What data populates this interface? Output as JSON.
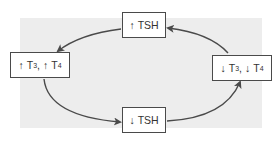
{
  "diagram": {
    "type": "feedback-cycle",
    "nodes": {
      "top": {
        "arrow": "↑",
        "label": "TSH"
      },
      "left": {
        "arrow1": "↑",
        "t1": "T",
        "sub1": "3",
        "sep": ",",
        "arrow2": "↑",
        "t2": "T",
        "sub2": "4"
      },
      "bottom": {
        "arrow": "↓",
        "label": "TSH"
      },
      "right": {
        "arrow1": "↓",
        "t1": "T",
        "sub1": "3",
        "sep": ",",
        "arrow2": "↓",
        "t2": "T",
        "sub2": "4"
      }
    },
    "edges": [
      {
        "from": "↑ TSH",
        "to": "↑ T3, ↑ T4"
      },
      {
        "from": "↑ T3, ↑ T4",
        "to": "↓ TSH"
      },
      {
        "from": "↓ TSH",
        "to": "↓ T3, ↓ T4"
      },
      {
        "from": "↓ T3, ↓ T4",
        "to": "↑ TSH"
      }
    ],
    "colors": {
      "background": "#ededed",
      "stroke": "#4a4a4a",
      "text": "#333333"
    }
  }
}
